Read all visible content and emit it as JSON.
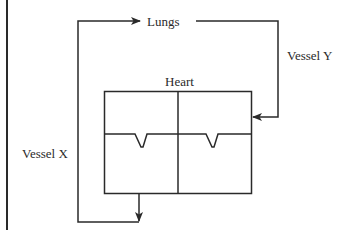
{
  "diagram": {
    "labels": {
      "lungs": "Lungs",
      "heart": "Heart",
      "vessel_x": "Vessel X",
      "vessel_y": "Vessel Y"
    },
    "colors": {
      "line": "#2a2a2a",
      "background": "#ffffff"
    },
    "heart_chambers": 4,
    "valves": 2
  }
}
